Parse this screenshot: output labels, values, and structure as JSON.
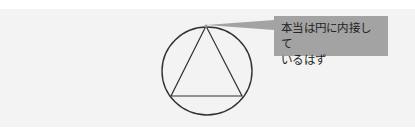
{
  "diagram": {
    "shapes": [
      {
        "type": "circle",
        "label": "circle",
        "cx": 207,
        "cy": 71,
        "r": 45
      },
      {
        "type": "triangle",
        "label": "triangle",
        "points": [
          [
            206,
            26
          ],
          [
            171,
            96
          ],
          [
            242,
            96
          ]
        ]
      }
    ],
    "callout": {
      "line1": "本当は円に内接して",
      "line2": "いるはず",
      "fill": "#a3a3a3"
    },
    "colors": {
      "background_band": "#f3f3f3",
      "stroke": "#333333"
    }
  }
}
